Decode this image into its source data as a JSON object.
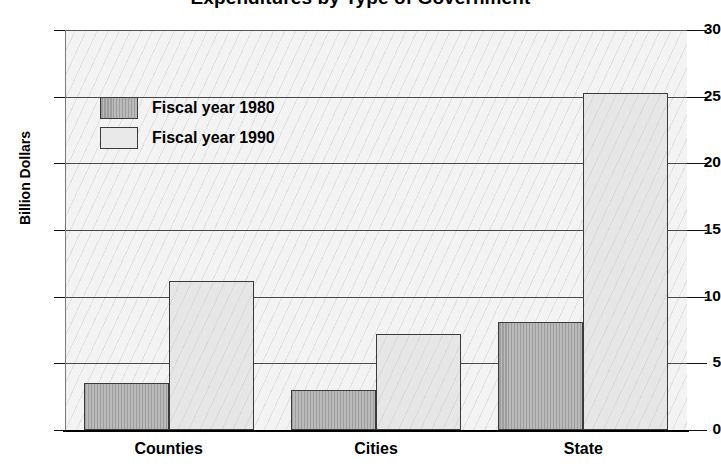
{
  "chart_data": {
    "type": "bar",
    "title": "Expenditures by Type of Government",
    "xlabel": "",
    "ylabel": "Billion Dollars",
    "categories": [
      "Counties",
      "Cities",
      "State"
    ],
    "series": [
      {
        "name": "Fiscal year 1980",
        "color": "#9d9d9d",
        "values": [
          3.5,
          3.0,
          8.1
        ]
      },
      {
        "name": "Fiscal year 1990",
        "color": "#e6e6e6",
        "values": [
          11.2,
          7.2,
          25.3
        ]
      }
    ],
    "ylim": [
      0,
      30
    ],
    "yticks": [
      0,
      5,
      10,
      15,
      20,
      25,
      30
    ],
    "ytick_labels": [
      "0",
      "5",
      "10",
      "15",
      "20",
      "25",
      "30"
    ],
    "grid": true,
    "legend_position": "top-left"
  },
  "axis": {
    "y_title": "Billion Dollars"
  },
  "legend": {
    "entries": [
      {
        "label": "Fiscal year 1980"
      },
      {
        "label": "Fiscal year 1990"
      }
    ]
  }
}
